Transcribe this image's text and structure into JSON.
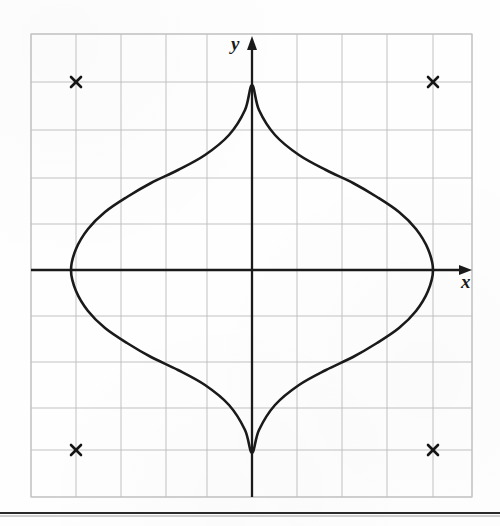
{
  "figure": {
    "background_color": "#fefefe",
    "ink_color": "#1a1a1a",
    "grid_color": "#b9b9b9",
    "grid_border_color": "#c9c9c9"
  },
  "axes": {
    "x_label": "x",
    "y_label": "y",
    "x_label_position": {
      "x": 466,
      "y": 284
    },
    "y_label_position": {
      "x": 236,
      "y": 48
    },
    "origin_px": {
      "x": 252,
      "y": 270
    },
    "x_axis_arrow_tip_px": 472,
    "y_axis_arrow_tip_px": 37
  },
  "grid": {
    "left_px": 31,
    "right_px": 472,
    "top_px": 34,
    "bottom_px": 497,
    "cell_width_px": 45.0,
    "cell_height_px": 46.3,
    "vertical_lines_px": [
      31,
      76,
      121,
      166,
      207,
      252,
      297,
      342,
      387,
      433,
      472
    ],
    "horizontal_lines_px": [
      34,
      82,
      130,
      178,
      224,
      270,
      316,
      362,
      408,
      450,
      497
    ],
    "columns": 10,
    "rows": 10
  },
  "chart_data": {
    "type": "line",
    "subtitle": "x^(2/3) + y^(2/3) = 4^(2/3)",
    "xlabel": "x",
    "ylabel": "y",
    "xlim": [
      -5,
      5
    ],
    "ylim": [
      -5,
      5
    ],
    "grid": true,
    "legend": "none",
    "curve_name": "astroid",
    "equation": "x = 4 cos^3(t),  y = 4 sin^3(t)",
    "parameter_a": 4,
    "cusps": [
      {
        "label": "left-cusp",
        "x": -4,
        "y": 0,
        "px": {
          "x": 71,
          "y": 270
        }
      },
      {
        "label": "top-cusp",
        "x": 0,
        "y": 4,
        "px": {
          "x": 252,
          "y": 85
        }
      },
      {
        "label": "right-cusp",
        "x": 4,
        "y": 0,
        "px": {
          "x": 433,
          "y": 270
        }
      },
      {
        "label": "bottom-cusp",
        "x": 0,
        "y": -4,
        "px": {
          "x": 252,
          "y": 453
        }
      }
    ],
    "marked_points": [
      {
        "label": "x-mark-top-left",
        "x": -4,
        "y": 4,
        "px": {
          "x": 76,
          "y": 82
        },
        "marker": "x"
      },
      {
        "label": "x-mark-top-right",
        "x": 4,
        "y": 4,
        "px": {
          "x": 433,
          "y": 82
        },
        "marker": "x"
      },
      {
        "label": "x-mark-bottom-left",
        "x": -4,
        "y": -4,
        "px": {
          "x": 76,
          "y": 450
        },
        "marker": "x"
      },
      {
        "label": "x-mark-bottom-right",
        "x": 4,
        "y": -4,
        "px": {
          "x": 433,
          "y": 450
        },
        "marker": "x"
      }
    ],
    "series": [
      {
        "name": "astroid",
        "closed": true,
        "stroke": "#1a1a1a",
        "points_px": [
          {
            "x": 433,
            "y": 270
          },
          {
            "x": 428,
            "y": 249
          },
          {
            "x": 416,
            "y": 229
          },
          {
            "x": 399,
            "y": 212
          },
          {
            "x": 377,
            "y": 197
          },
          {
            "x": 353,
            "y": 183
          },
          {
            "x": 326,
            "y": 170
          },
          {
            "x": 299,
            "y": 155
          },
          {
            "x": 275,
            "y": 135
          },
          {
            "x": 259,
            "y": 110
          },
          {
            "x": 252,
            "y": 85
          },
          {
            "x": 245,
            "y": 110
          },
          {
            "x": 229,
            "y": 135
          },
          {
            "x": 205,
            "y": 155
          },
          {
            "x": 178,
            "y": 170
          },
          {
            "x": 151,
            "y": 183
          },
          {
            "x": 127,
            "y": 197
          },
          {
            "x": 105,
            "y": 212
          },
          {
            "x": 88,
            "y": 229
          },
          {
            "x": 76,
            "y": 249
          },
          {
            "x": 71,
            "y": 270
          },
          {
            "x": 76,
            "y": 291
          },
          {
            "x": 88,
            "y": 311
          },
          {
            "x": 105,
            "y": 328
          },
          {
            "x": 127,
            "y": 343
          },
          {
            "x": 151,
            "y": 357
          },
          {
            "x": 178,
            "y": 370
          },
          {
            "x": 205,
            "y": 385
          },
          {
            "x": 229,
            "y": 405
          },
          {
            "x": 245,
            "y": 430
          },
          {
            "x": 252,
            "y": 453
          },
          {
            "x": 259,
            "y": 430
          },
          {
            "x": 275,
            "y": 405
          },
          {
            "x": 299,
            "y": 385
          },
          {
            "x": 326,
            "y": 370
          },
          {
            "x": 353,
            "y": 357
          },
          {
            "x": 377,
            "y": 343
          },
          {
            "x": 399,
            "y": 328
          },
          {
            "x": 416,
            "y": 311
          },
          {
            "x": 428,
            "y": 291
          },
          {
            "x": 433,
            "y": 270
          }
        ]
      }
    ]
  },
  "footer_rule": {
    "y_px": 513,
    "color": "#2b2b2b"
  }
}
